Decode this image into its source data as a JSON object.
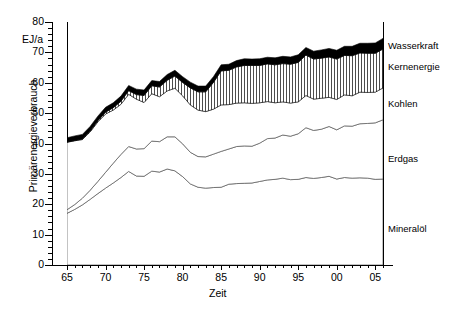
{
  "chart_data": {
    "type": "area",
    "title": "",
    "xlabel": "Zeit",
    "ylabel": "Primärenergieverbrauch",
    "yunit": "EJ/a",
    "xlim": [
      1965,
      2006
    ],
    "ylim": [
      0,
      80
    ],
    "ytick_step": 10,
    "ytick_minor_step": 2,
    "xtick_step": 5,
    "xtick_minor_step": 1,
    "grid": false,
    "stacked": true,
    "legend_position": "right-inline",
    "ytick_labels": [
      "0",
      "10",
      "20",
      "30",
      "40",
      "50",
      "60",
      "70",
      "80"
    ],
    "xtick_labels": [
      "65",
      "70",
      "75",
      "80",
      "85",
      "90",
      "95",
      "00",
      "05"
    ],
    "x": [
      1965,
      1966,
      1967,
      1968,
      1969,
      1970,
      1971,
      1972,
      1973,
      1974,
      1975,
      1976,
      1977,
      1978,
      1979,
      1980,
      1981,
      1982,
      1983,
      1984,
      1985,
      1986,
      1987,
      1988,
      1989,
      1990,
      1991,
      1992,
      1993,
      1994,
      1995,
      1996,
      1997,
      1998,
      1999,
      2000,
      2001,
      2002,
      2003,
      2004,
      2005,
      2006
    ],
    "series": [
      {
        "name": "Mineralöl",
        "color": "#ffffff",
        "pattern": "solid-white",
        "values": [
          17.0,
          18.3,
          19.8,
          21.6,
          23.5,
          25.3,
          27.0,
          28.8,
          30.8,
          29.3,
          29.2,
          30.9,
          30.6,
          31.6,
          31.0,
          29.1,
          26.7,
          25.6,
          25.3,
          25.5,
          25.6,
          26.6,
          26.8,
          26.9,
          27.0,
          27.5,
          28.0,
          28.2,
          28.6,
          28.1,
          28.2,
          28.8,
          28.5,
          28.8,
          29.2,
          28.3,
          28.8,
          28.6,
          28.7,
          28.6,
          28.2,
          28.3
        ]
      },
      {
        "name": "Erdgas",
        "color": "#ffffff",
        "pattern": "solid-white",
        "values": [
          1.2,
          1.6,
          2.2,
          3.0,
          4.0,
          5.2,
          6.5,
          7.6,
          8.2,
          8.9,
          9.1,
          9.9,
          10.0,
          10.6,
          11.2,
          10.8,
          10.4,
          10.1,
          10.3,
          11.0,
          11.8,
          11.6,
          12.2,
          12.3,
          12.1,
          12.6,
          13.6,
          13.6,
          14.2,
          14.3,
          15.0,
          16.4,
          15.8,
          15.9,
          16.4,
          16.2,
          17.0,
          17.1,
          17.8,
          18.0,
          18.6,
          19.5
        ]
      },
      {
        "name": "Kohlen",
        "color": "#ffffff",
        "pattern": "solid-white",
        "values": [
          22.2,
          21.0,
          19.3,
          19.2,
          19.6,
          19.2,
          17.5,
          16.5,
          17.2,
          16.4,
          15.2,
          15.6,
          14.8,
          15.1,
          16.0,
          15.8,
          15.6,
          15.3,
          14.9,
          14.8,
          15.3,
          14.6,
          14.3,
          14.2,
          14.1,
          13.3,
          12.2,
          11.6,
          10.9,
          10.9,
          10.5,
          10.6,
          10.3,
          10.2,
          9.6,
          10.0,
          10.2,
          10.0,
          10.4,
          10.2,
          10.1,
          10.5
        ]
      },
      {
        "name": "Kernenergie",
        "color": "#ffffff",
        "pattern": "vertical-hatch",
        "values": [
          0.1,
          0.1,
          0.2,
          0.3,
          0.4,
          0.6,
          0.8,
          1.0,
          1.2,
          1.5,
          2.3,
          2.6,
          3.2,
          3.5,
          4.0,
          4.4,
          5.6,
          6.0,
          6.5,
          8.8,
          11.2,
          11.3,
          11.9,
          12.3,
          12.5,
          12.3,
          12.4,
          12.5,
          12.6,
          12.8,
          13.0,
          13.3,
          13.2,
          13.2,
          13.3,
          13.3,
          13.0,
          13.2,
          12.9,
          12.9,
          12.8,
          12.8
        ]
      },
      {
        "name": "Wasserkraft",
        "color": "#000000",
        "pattern": "solid-black",
        "values": [
          1.4,
          1.5,
          1.5,
          1.5,
          1.5,
          1.6,
          1.6,
          1.7,
          1.7,
          1.8,
          1.8,
          1.7,
          1.8,
          1.9,
          1.9,
          1.9,
          1.9,
          1.9,
          1.9,
          1.9,
          2.0,
          2.0,
          2.1,
          2.2,
          2.1,
          2.2,
          2.2,
          2.3,
          2.4,
          2.4,
          2.5,
          2.5,
          2.6,
          2.7,
          2.8,
          2.9,
          3.0,
          3.1,
          3.2,
          3.3,
          3.4,
          3.5
        ]
      }
    ],
    "totals": [
      41.9,
      42.5,
      43.0,
      45.6,
      49.0,
      51.9,
      53.4,
      55.6,
      59.1,
      57.9,
      57.6,
      60.7,
      60.4,
      62.7,
      64.1,
      62.0,
      60.2,
      58.9,
      58.9,
      62.0,
      65.9,
      66.1,
      67.3,
      67.9,
      67.8,
      67.9,
      68.4,
      68.2,
      68.7,
      68.5,
      69.2,
      71.6,
      70.4,
      70.8,
      71.3,
      70.7,
      72.0,
      72.0,
      73.0,
      73.0,
      73.1,
      74.6
    ]
  },
  "legend": {
    "items": [
      {
        "label": "Wasserkraft",
        "y": 40
      },
      {
        "label": "Kernenergie",
        "y": 61
      },
      {
        "label": "Kohlen",
        "y": 98
      },
      {
        "label": "Erdgas",
        "y": 153
      },
      {
        "label": "Mineralöl",
        "y": 223
      }
    ]
  },
  "axes": {
    "y_unit_label": "EJ/a",
    "y_title": "Primärenergieverbrauch",
    "x_title": "Zeit"
  }
}
